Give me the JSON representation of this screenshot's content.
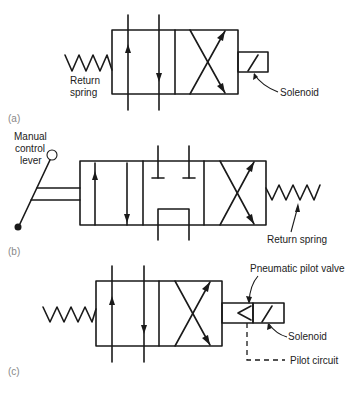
{
  "figure": {
    "panels": [
      {
        "id": "a",
        "caption": "(a)",
        "labels": {
          "spring_line1": "Return",
          "spring_line2": "spring",
          "solenoid": "Solenoid"
        }
      },
      {
        "id": "b",
        "caption": "(b)",
        "labels": {
          "lever_line1": "Manual",
          "lever_line2": "control",
          "lever_line3": "lever",
          "spring": "Return spring"
        }
      },
      {
        "id": "c",
        "caption": "(c)",
        "labels": {
          "pilot_valve": "Pneumatic pilot valve",
          "solenoid": "Solenoid",
          "pilot_circuit": "Pilot circuit"
        }
      }
    ],
    "line_color": "#1a1a1a",
    "caption_color": "#888888"
  }
}
